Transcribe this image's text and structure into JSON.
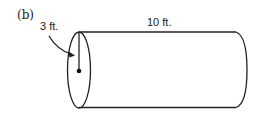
{
  "figure": {
    "part_label": "(b)",
    "shape": "cylinder",
    "radius_label": "3 ft.",
    "length_label": "10 ft.",
    "colors": {
      "stroke": "#222222",
      "background": "#ffffff"
    }
  }
}
